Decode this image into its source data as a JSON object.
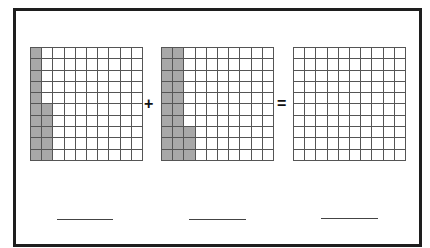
{
  "worksheet": {
    "operators": {
      "plus": "+",
      "equals": "="
    },
    "grids": [
      {
        "id": "addend-1",
        "rows": 10,
        "cols": 10,
        "shaded_full_columns": 1,
        "partial_column_bottom_cells": 5,
        "shaded_total": 15
      },
      {
        "id": "addend-2",
        "rows": 10,
        "cols": 10,
        "shaded_full_columns": 2,
        "partial_column_bottom_cells": 3,
        "shaded_total": 23
      },
      {
        "id": "sum",
        "rows": 10,
        "cols": 10,
        "shaded_full_columns": 0,
        "partial_column_bottom_cells": 0,
        "shaded_total": 0
      }
    ],
    "answer_blanks": [
      "",
      "",
      ""
    ],
    "colors": {
      "shade": "#a8a8a8",
      "grid_line": "#555555",
      "frame": "#1e1e1e"
    }
  }
}
